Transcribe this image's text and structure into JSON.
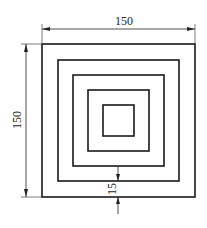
{
  "diagram": {
    "type": "technical-drawing",
    "squares_count": 5,
    "dimensions": {
      "width_label": "150",
      "height_label": "150",
      "spacing_label": "15"
    },
    "colors": {
      "line": "#1a1a1a",
      "background": "#ffffff"
    }
  }
}
